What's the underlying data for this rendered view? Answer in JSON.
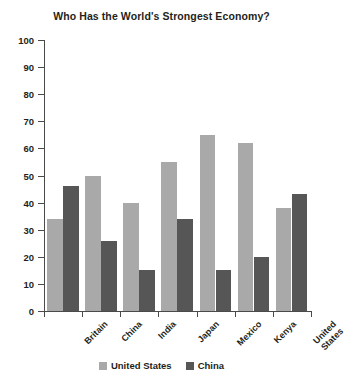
{
  "chart_data": {
    "type": "bar",
    "title": "Who Has the World's Strongest Economy?",
    "xlabel": "",
    "ylabel": "",
    "ylim": [
      0,
      100
    ],
    "yticks": [
      0,
      10,
      20,
      30,
      40,
      50,
      60,
      70,
      80,
      90,
      100
    ],
    "ytick_labels": [
      "0",
      "10",
      "20",
      "30",
      "40",
      "50",
      "60",
      "70",
      "80",
      "90",
      "100"
    ],
    "grid": false,
    "legend_position": "bottom",
    "categories": [
      "Britain",
      "China",
      "India",
      "Japan",
      "Mexico",
      "Kenya",
      "United\nStates"
    ],
    "category_labels": [
      "Britain",
      "China",
      "India",
      "Japan",
      "Mexico",
      "Kenya",
      "United States"
    ],
    "series": [
      {
        "name": "United States",
        "color": "#a9a9a9",
        "values": [
          34,
          50,
          40,
          55,
          65,
          62,
          38
        ]
      },
      {
        "name": "China",
        "color": "#565656",
        "values": [
          46,
          26,
          15,
          34,
          15,
          20,
          43
        ]
      }
    ]
  },
  "legend": {
    "items": [
      {
        "label": "United States",
        "color": "#a9a9a9"
      },
      {
        "label": "China",
        "color": "#565656"
      }
    ]
  },
  "axis": {
    "tick_color": "#4a4a4a"
  }
}
